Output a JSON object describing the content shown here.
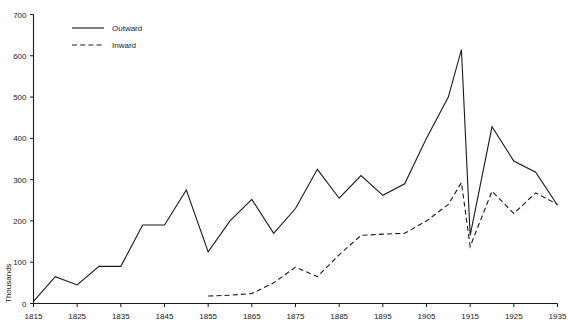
{
  "chart_data": {
    "type": "line",
    "title": "",
    "xlabel": "",
    "ylabel": "Thousands",
    "xlim": [
      1815,
      1935
    ],
    "ylim": [
      0,
      700
    ],
    "xticks": [
      1815,
      1825,
      1835,
      1845,
      1855,
      1865,
      1875,
      1885,
      1895,
      1905,
      1915,
      1925,
      1935
    ],
    "yticks": [
      0,
      100,
      200,
      300,
      400,
      500,
      600,
      700
    ],
    "grid": false,
    "legend_position": "top-left",
    "legend": [
      "Outward",
      "Inward"
    ],
    "series": [
      {
        "name": "Outward",
        "style": "solid",
        "x": [
          1815,
          1820,
          1825,
          1830,
          1835,
          1840,
          1845,
          1850,
          1855,
          1860,
          1865,
          1870,
          1875,
          1880,
          1885,
          1890,
          1895,
          1900,
          1905,
          1910,
          1913,
          1915,
          1920,
          1925,
          1930,
          1935
        ],
        "values": [
          5,
          65,
          45,
          90,
          90,
          190,
          190,
          275,
          125,
          200,
          252,
          170,
          230,
          325,
          255,
          310,
          262,
          290,
          400,
          500,
          615,
          165,
          428,
          345,
          318,
          238
        ]
      },
      {
        "name": "Inward",
        "style": "dashed",
        "x": [
          1855,
          1860,
          1865,
          1870,
          1875,
          1880,
          1885,
          1890,
          1895,
          1900,
          1905,
          1910,
          1913,
          1915,
          1920,
          1925,
          1930,
          1935
        ],
        "values": [
          18,
          20,
          24,
          50,
          88,
          65,
          118,
          165,
          168,
          170,
          200,
          240,
          293,
          138,
          272,
          218,
          268,
          240
        ]
      }
    ]
  },
  "axis": {
    "y_title": "Thousands",
    "x_tick_labels": [
      "1815",
      "1825",
      "1835",
      "1845",
      "1855",
      "1865",
      "1875",
      "1885",
      "1895",
      "1905",
      "1915",
      "1925",
      "1935"
    ],
    "y_tick_labels": [
      "0",
      "100",
      "200",
      "300",
      "400",
      "500",
      "600",
      "700"
    ]
  },
  "legend": {
    "entries": [
      {
        "label": "Outward",
        "style": "solid"
      },
      {
        "label": "Inward",
        "style": "dashed"
      }
    ]
  }
}
